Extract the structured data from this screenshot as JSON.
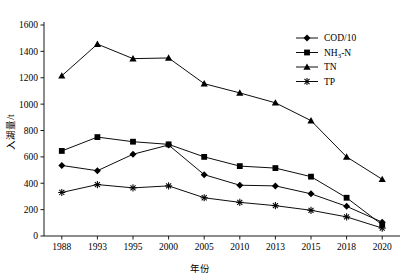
{
  "chart_data": {
    "type": "line",
    "title": "",
    "xlabel": "年份",
    "ylabel": "入湖量/t",
    "categories": [
      "1988",
      "1993",
      "1995",
      "2000",
      "2005",
      "2010",
      "2013",
      "2015",
      "2018",
      "2020"
    ],
    "ylim": [
      0,
      1600
    ],
    "yticks": [
      0,
      200,
      400,
      600,
      800,
      1000,
      1200,
      1400,
      1600
    ],
    "grid": false,
    "legend_position": "top-right",
    "series": [
      {
        "name": "COD/10",
        "marker": "diamond",
        "values": [
          535,
          495,
          620,
          690,
          465,
          385,
          380,
          320,
          225,
          105
        ]
      },
      {
        "name": "NH3-N",
        "marker": "square",
        "values": [
          645,
          750,
          715,
          695,
          600,
          530,
          515,
          450,
          290,
          85
        ]
      },
      {
        "name": "TN",
        "marker": "triangle",
        "values": [
          1215,
          1455,
          1345,
          1350,
          1155,
          1085,
          1010,
          875,
          600,
          430
        ]
      },
      {
        "name": "TP",
        "marker": "asterisk",
        "values": [
          330,
          390,
          365,
          380,
          290,
          255,
          230,
          195,
          145,
          60
        ]
      }
    ]
  },
  "legend": {
    "items": [
      {
        "label": "COD/10",
        "base": "COD/10",
        "sub": "",
        "tail": ""
      },
      {
        "label": "NH3-N",
        "base": "NH",
        "sub": "3",
        "tail": "-N"
      },
      {
        "label": "TN",
        "base": "TN",
        "sub": "",
        "tail": ""
      },
      {
        "label": "TP",
        "base": "TP",
        "sub": "",
        "tail": ""
      }
    ]
  },
  "axes": {
    "x_title": "年份",
    "y_title": "入湖量/t"
  }
}
